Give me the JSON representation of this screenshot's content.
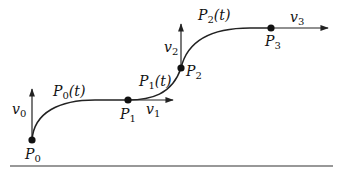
{
  "diagram": {
    "type": "piecewise-curve-with-tangent-vectors",
    "colors": {
      "ink": "#111111",
      "background": "#ffffff"
    },
    "points": [
      {
        "id": "P0",
        "base": "P",
        "sub": "0",
        "x": 32,
        "y": 140
      },
      {
        "id": "P1",
        "base": "P",
        "sub": "1",
        "x": 128,
        "y": 100
      },
      {
        "id": "P2",
        "base": "P",
        "sub": "2",
        "x": 181,
        "y": 68
      },
      {
        "id": "P3",
        "base": "P",
        "sub": "3",
        "x": 271,
        "y": 28
      }
    ],
    "vectors": [
      {
        "id": "v0",
        "base": "v",
        "sub": "0",
        "direction": "up"
      },
      {
        "id": "v1",
        "base": "v",
        "sub": "1",
        "direction": "right"
      },
      {
        "id": "v2",
        "base": "v",
        "sub": "2",
        "direction": "up"
      },
      {
        "id": "v3",
        "base": "v",
        "sub": "3",
        "direction": "right"
      }
    ],
    "segments": [
      {
        "id": "P0t",
        "base": "P",
        "sub": "0",
        "param": "(t)",
        "from": "P0",
        "to": "P1"
      },
      {
        "id": "P1t",
        "base": "P",
        "sub": "1",
        "param": "(t)",
        "from": "P1",
        "to": "P2"
      },
      {
        "id": "P2t",
        "base": "P",
        "sub": "2",
        "param": "(t)",
        "from": "P2",
        "to": "P3"
      }
    ],
    "baseline": {
      "visible": true
    }
  }
}
